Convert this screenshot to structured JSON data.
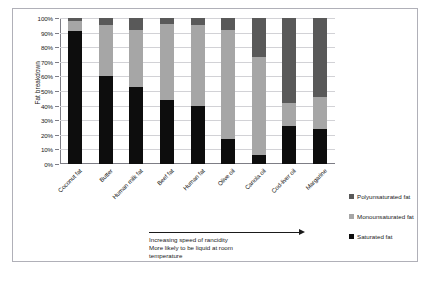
{
  "chart_data": {
    "type": "bar",
    "stacked": true,
    "title": "",
    "xlabel": "",
    "ylabel": "Fat breakdown",
    "ylim": [
      0,
      100
    ],
    "y_tick_labels": [
      "100%",
      "90%",
      "80%",
      "70%",
      "60%",
      "50%",
      "40%",
      "30%",
      "20%",
      "10%",
      "0%"
    ],
    "y_tick_values": [
      100,
      90,
      80,
      70,
      60,
      50,
      40,
      30,
      20,
      10,
      0
    ],
    "grid": true,
    "legend_position": "right",
    "categories": [
      "Coconut fat",
      "Butter",
      "Human milk fat",
      "Beef fat",
      "Human fat",
      "Olive oil",
      "Canola oil",
      "Cod-liver oil",
      "Margarine"
    ],
    "series": [
      {
        "name": "Saturated fat",
        "color": "#0d0d0d",
        "values": [
          91,
          60,
          53,
          44,
          40,
          17,
          6,
          26,
          24
        ]
      },
      {
        "name": "Monounsaturated fat",
        "color": "#a6a6a6",
        "values": [
          7,
          35,
          39,
          52,
          55,
          75,
          67,
          16,
          22
        ]
      },
      {
        "name": "Polyunsaturated fat",
        "color": "#595959",
        "values": [
          2,
          5,
          8,
          4,
          5,
          8,
          27,
          58,
          54
        ]
      }
    ],
    "annotations": [
      "Increasing speed of rancidity",
      "More likely to be liquid at room",
      "temperature"
    ],
    "annotation_arrow": "right-arrow"
  },
  "legend": {
    "items": [
      {
        "label": "Polyunsaturated fat",
        "color": "#595959"
      },
      {
        "label": "Monounsaturated fat",
        "color": "#a6a6a6"
      },
      {
        "label": "Saturated fat",
        "color": "#0d0d0d"
      }
    ]
  }
}
